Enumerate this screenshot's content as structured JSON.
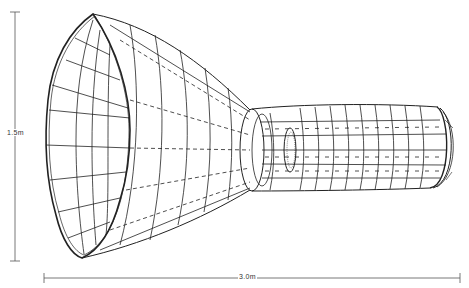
{
  "diagram": {
    "dimensions": {
      "height_label": "1.5m",
      "length_label": "3.0m"
    },
    "colors": {
      "line": "#222222",
      "dim_line": "#555555",
      "background": "#ffffff"
    }
  }
}
